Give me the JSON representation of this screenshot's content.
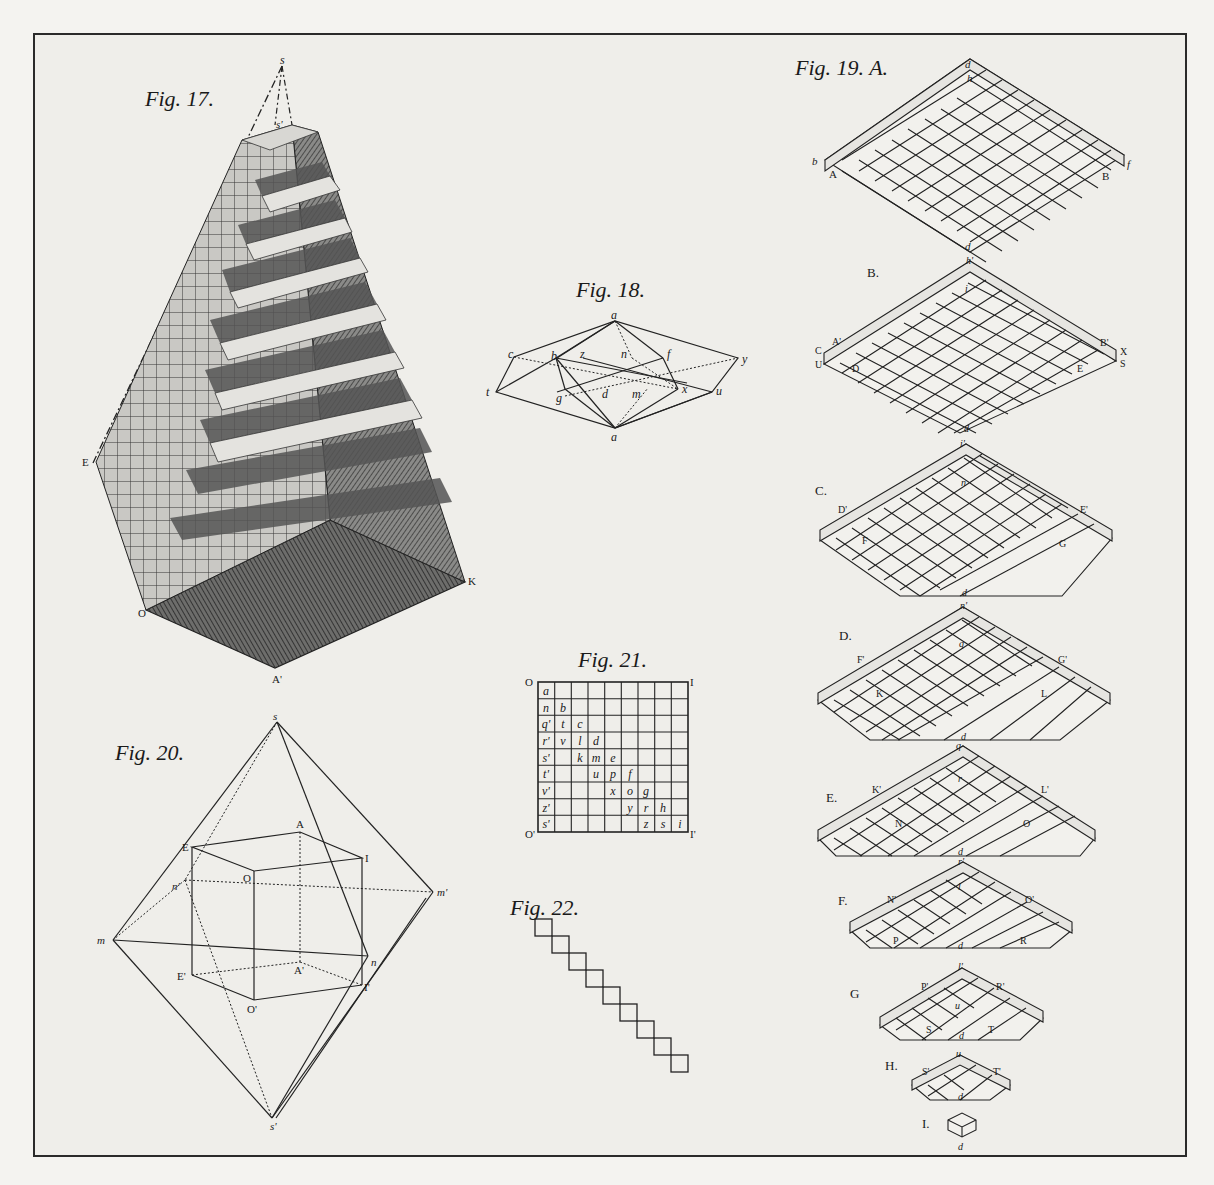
{
  "plate": {
    "figures": [
      {
        "id": "fig17",
        "title": "Fig. 17.",
        "labels": [
          "s",
          "s'",
          "E",
          "O",
          "K",
          "A'"
        ]
      },
      {
        "id": "fig18",
        "title": "Fig. 18.",
        "labels": [
          "a",
          "c",
          "b",
          "z",
          "n",
          "f",
          "y",
          "t",
          "g",
          "d",
          "m",
          "x",
          "u",
          "a"
        ]
      },
      {
        "id": "fig19",
        "title": "Fig. 19. A.",
        "sections": [
          {
            "name": "A.",
            "labels": [
              "d",
              "h",
              "b",
              "A",
              "B",
              "f",
              "d"
            ]
          },
          {
            "name": "B.",
            "labels": [
              "h'",
              "i",
              "A'",
              "B'",
              "C",
              "U",
              "D",
              "E",
              "X",
              "S",
              "d"
            ]
          },
          {
            "name": "C.",
            "labels": [
              "i'",
              "n",
              "D'",
              "E'",
              "F",
              "G",
              "d"
            ]
          },
          {
            "name": "D.",
            "labels": [
              "n'",
              "q",
              "F'",
              "G'",
              "K",
              "L",
              "d"
            ]
          },
          {
            "name": "E.",
            "labels": [
              "q",
              "r",
              "K'",
              "L'",
              "N",
              "O",
              "d"
            ]
          },
          {
            "name": "F.",
            "labels": [
              "r'",
              "l",
              "N'",
              "O'",
              "P",
              "R",
              "d"
            ]
          },
          {
            "name": "G",
            "labels": [
              "l'",
              "u",
              "P'",
              "R'",
              "S",
              "T",
              "d"
            ]
          },
          {
            "name": "H.",
            "labels": [
              "u",
              "S'",
              "T'",
              "d"
            ]
          },
          {
            "name": "I.",
            "labels": [
              "d"
            ]
          }
        ]
      },
      {
        "id": "fig20",
        "title": "Fig. 20.",
        "labels": [
          "s",
          "A",
          "E",
          "I",
          "O",
          "n'",
          "m'",
          "m",
          "n",
          "E'",
          "A'",
          "I'",
          "O'",
          "s'"
        ]
      },
      {
        "id": "fig21",
        "title": "Fig. 21.",
        "corners": [
          "O",
          "I",
          "O'",
          "I'"
        ],
        "grid_rows": [
          [
            "a",
            "",
            "",
            "",
            "",
            "",
            "",
            "",
            ""
          ],
          [
            "n",
            "b",
            "",
            "",
            "",
            "",
            "",
            "",
            ""
          ],
          [
            "q'",
            "t",
            "c",
            "",
            "",
            "",
            "",
            "",
            ""
          ],
          [
            "r'",
            "v",
            "l",
            "d",
            "",
            "",
            "",
            "",
            ""
          ],
          [
            "s'",
            "",
            "k",
            "m",
            "e",
            "",
            "",
            "",
            ""
          ],
          [
            "t'",
            "",
            "",
            "u",
            "p",
            "f",
            "",
            "",
            ""
          ],
          [
            "v'",
            "",
            "",
            "",
            "x",
            "o",
            "g",
            "",
            ""
          ],
          [
            "z'",
            "",
            "",
            "",
            "",
            "y",
            "r",
            "h",
            ""
          ],
          [
            "s'",
            "",
            "",
            "",
            "",
            "",
            "z",
            "s",
            "i"
          ]
        ]
      },
      {
        "id": "fig22",
        "title": "Fig. 22.",
        "steps": 9
      }
    ]
  }
}
